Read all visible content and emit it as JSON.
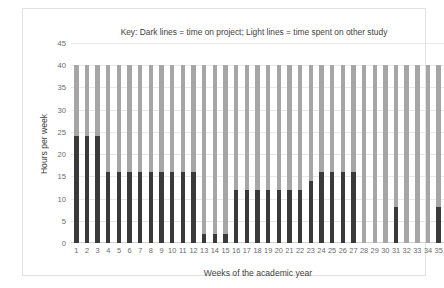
{
  "chart_data": {
    "type": "bar",
    "title": "Key: Dark lines = time on project; Light lines = time spent on other study",
    "xlabel": "Weeks of the academic year",
    "ylabel": "Hours per week",
    "ylim": [
      0,
      45
    ],
    "ytick_step": 5,
    "yticks": [
      0,
      5,
      10,
      15,
      20,
      25,
      30,
      35,
      40,
      45
    ],
    "grid": true,
    "legend_position": "none",
    "categories": [
      1,
      2,
      3,
      4,
      5,
      6,
      7,
      8,
      9,
      10,
      11,
      12,
      13,
      14,
      15,
      16,
      17,
      18,
      19,
      20,
      21,
      22,
      23,
      24,
      25,
      26,
      27,
      28,
      29,
      30,
      31,
      32,
      33,
      34,
      35
    ],
    "series": [
      {
        "name": "time spent on other study",
        "style": "Light lines",
        "color": "#a6a6a6",
        "values": [
          40,
          40,
          40,
          40,
          40,
          40,
          40,
          40,
          40,
          40,
          40,
          40,
          40,
          40,
          40,
          40,
          40,
          40,
          40,
          40,
          40,
          40,
          40,
          40,
          40,
          40,
          40,
          40,
          40,
          40,
          40,
          40,
          40,
          40,
          40
        ]
      },
      {
        "name": "time on project",
        "style": "Dark lines",
        "color": "#3a3a3a",
        "values": [
          24,
          24,
          24,
          16,
          16,
          16,
          16,
          16,
          16,
          16,
          16,
          16,
          2,
          2,
          2,
          12,
          12,
          12,
          12,
          12,
          12,
          12,
          14,
          16,
          16,
          16,
          16,
          0,
          0,
          0,
          8,
          0,
          0,
          0,
          8
        ]
      }
    ]
  },
  "colors": {
    "light_series": "#a6a6a6",
    "dark_series": "#3a3a3a",
    "gridline": "#e8e8e8",
    "border": "#e2e2e2",
    "text": "#3f3f3f",
    "tick_text": "#6b6b6b"
  }
}
